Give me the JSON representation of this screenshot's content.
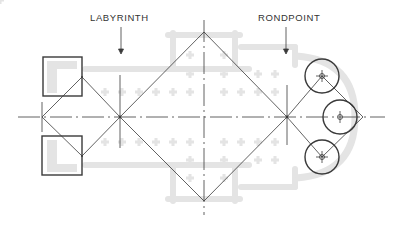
{
  "labels": {
    "labyrinth": "LABYRINTH",
    "rondpoint": "RONDPOINT"
  },
  "colors": {
    "background": "#ffffff",
    "line": "#3a3a3a",
    "plan_ghost": "#e3e3e3",
    "text": "#333333"
  }
}
